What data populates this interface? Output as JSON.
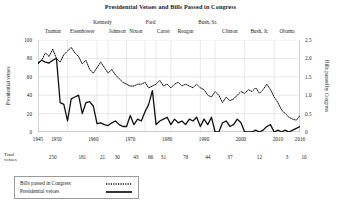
{
  "chart_data": {
    "type": "line",
    "title": "Presidential Vetoes and Bills Passed in Congress",
    "xlabel": "",
    "ylabel": "Presidential vetoes",
    "y2label": "Bills passed by Congress",
    "ylim": [
      0,
      100
    ],
    "y2lim": [
      0,
      2.5
    ],
    "xlim": [
      1945,
      2016
    ],
    "grid": true,
    "legend_position": "below-left",
    "y_ticks": [
      "0",
      "20",
      "40",
      "60",
      "80",
      "100"
    ],
    "y_tick_values": [
      0,
      20,
      40,
      60,
      80,
      100
    ],
    "y2_ticks": [
      "0",
      "0.5",
      "1.0",
      "1.5",
      "2.0",
      "2.5"
    ],
    "y2_tick_values": [
      0,
      0.5,
      1.0,
      1.5,
      2.0,
      2.5
    ],
    "x_ticks": [
      "1945",
      "1950",
      "1960",
      "1970",
      "1980",
      "1990",
      "2000",
      "2010",
      "2016"
    ],
    "x_tick_values": [
      1945,
      1950,
      1960,
      1970,
      1980,
      1990,
      2000,
      2010,
      2016
    ],
    "series": [
      {
        "name": "Presidential vetoes",
        "style": "solid",
        "axis": "left",
        "x": [
          1945,
          1946,
          1947,
          1948,
          1949,
          1950,
          1951,
          1952,
          1953,
          1954,
          1955,
          1956,
          1957,
          1958,
          1959,
          1960,
          1961,
          1962,
          1963,
          1964,
          1965,
          1966,
          1967,
          1968,
          1969,
          1970,
          1971,
          1972,
          1973,
          1974,
          1975,
          1976,
          1977,
          1978,
          1979,
          1980,
          1981,
          1982,
          1983,
          1984,
          1985,
          1986,
          1987,
          1988,
          1989,
          1990,
          1991,
          1992,
          1993,
          1994,
          1995,
          1996,
          1997,
          1998,
          1999,
          2000,
          2001,
          2002,
          2003,
          2004,
          2005,
          2006,
          2007,
          2008,
          2009,
          2010,
          2011,
          2012,
          2013,
          2014,
          2015,
          2016
        ],
        "values": [
          75,
          78,
          76,
          75,
          78,
          80,
          32,
          30,
          12,
          36,
          38,
          40,
          20,
          32,
          33,
          28,
          9,
          10,
          8,
          7,
          10,
          12,
          8,
          6,
          6,
          18,
          8,
          14,
          12,
          22,
          30,
          45,
          8,
          12,
          14,
          16,
          8,
          14,
          10,
          12,
          8,
          14,
          12,
          16,
          6,
          14,
          8,
          16,
          0,
          0,
          10,
          12,
          6,
          8,
          14,
          10,
          0,
          0,
          0,
          2,
          0,
          2,
          6,
          8,
          0,
          2,
          0,
          2,
          0,
          2,
          4,
          6
        ],
        "president_totals_note": "series approximates annual veto counts"
      },
      {
        "name": "Bills passed in Congress",
        "style": "dotted",
        "axis": "right",
        "x": [
          1945,
          1946,
          1947,
          1948,
          1949,
          1950,
          1951,
          1952,
          1953,
          1954,
          1955,
          1956,
          1957,
          1958,
          1959,
          1960,
          1961,
          1962,
          1963,
          1964,
          1965,
          1966,
          1967,
          1968,
          1969,
          1970,
          1971,
          1972,
          1973,
          1974,
          1975,
          1976,
          1977,
          1978,
          1979,
          1980,
          1981,
          1982,
          1983,
          1984,
          1985,
          1986,
          1987,
          1988,
          1989,
          1990,
          1991,
          1992,
          1993,
          1994,
          1995,
          1996,
          1997,
          1998,
          1999,
          2000,
          2001,
          2002,
          2003,
          2004,
          2005,
          2006,
          2007,
          2008,
          2009,
          2010,
          2011,
          2012,
          2013,
          2014,
          2015,
          2016
        ],
        "values": [
          1.85,
          1.95,
          2.15,
          2.05,
          2.25,
          2.0,
          1.9,
          2.1,
          2.2,
          2.3,
          2.15,
          2.05,
          1.85,
          1.95,
          1.7,
          1.6,
          1.75,
          1.9,
          1.75,
          1.6,
          1.7,
          1.55,
          1.45,
          1.35,
          1.3,
          1.25,
          1.25,
          1.3,
          1.3,
          1.35,
          1.2,
          1.25,
          1.3,
          1.4,
          1.25,
          1.3,
          1.2,
          1.3,
          1.35,
          1.25,
          1.3,
          1.25,
          1.2,
          1.3,
          1.2,
          1.15,
          1.0,
          0.95,
          1.1,
          1.0,
          0.8,
          0.95,
          0.85,
          0.9,
          1.0,
          1.1,
          1.05,
          1.15,
          1.1,
          1.2,
          1.05,
          1.15,
          1.3,
          1.15,
          0.95,
          0.8,
          0.6,
          0.5,
          0.4,
          0.35,
          0.32,
          0.45
        ]
      }
    ],
    "presidents": [
      {
        "label": "Truman",
        "start": 1945,
        "end": 1953,
        "row": 1,
        "total_vetoes": "250"
      },
      {
        "label": "Eisenhower",
        "start": 1953,
        "end": 1961,
        "row": 1,
        "total_vetoes": "181"
      },
      {
        "label": "Kennedy",
        "start": 1961,
        "end": 1964,
        "row": 0,
        "total_vetoes": "21"
      },
      {
        "label": "Johnson",
        "start": 1964,
        "end": 1969,
        "row": 1,
        "total_vetoes": "30"
      },
      {
        "label": "Nixon",
        "start": 1969,
        "end": 1974,
        "row": 1,
        "total_vetoes": "43"
      },
      {
        "label": "Ford",
        "start": 1974,
        "end": 1977,
        "row": 0,
        "total_vetoes": "66"
      },
      {
        "label": "Carter",
        "start": 1977,
        "end": 1981,
        "row": 1,
        "total_vetoes": "31"
      },
      {
        "label": "Reagan",
        "start": 1981,
        "end": 1989,
        "row": 1,
        "total_vetoes": "78"
      },
      {
        "label": "Bush, Sr.",
        "start": 1989,
        "end": 1993,
        "row": 0,
        "total_vetoes": "44"
      },
      {
        "label": "Clinton",
        "start": 1993,
        "end": 2001,
        "row": 1,
        "total_vetoes": "37"
      },
      {
        "label": "Bush, Jr.",
        "start": 2001,
        "end": 2009,
        "row": 1,
        "total_vetoes": "12"
      },
      {
        "label": "Obama",
        "start": 2009,
        "end": 2016,
        "row": 1,
        "total_vetoes": "3"
      }
    ],
    "totals_row_label_line1": "Total",
    "totals_row_label_line2": "vetoes",
    "totals_row_values": [
      "250",
      "181",
      "21",
      "30",
      "43",
      "66",
      "31",
      "78",
      "44",
      "37",
      "12",
      "3",
      "10"
    ],
    "legend": [
      {
        "label": "Bills passed in Congress",
        "style": "dotted"
      },
      {
        "label": "Presidential vetoes",
        "style": "solid"
      }
    ],
    "colors": {
      "line": "#111111",
      "grid": "#d8d8d8",
      "axis": "#8a8a8a",
      "text": "#1a1a1a"
    }
  }
}
